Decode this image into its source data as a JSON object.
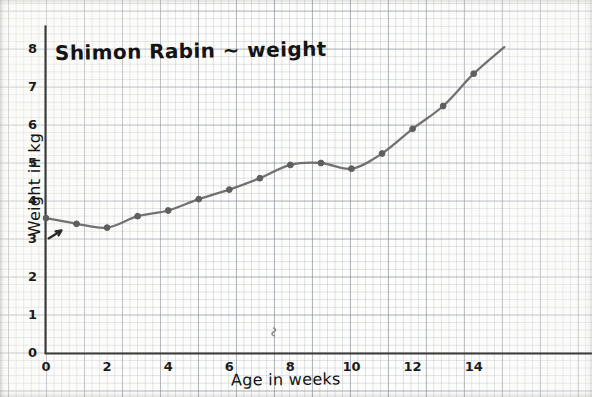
{
  "chart_data": {
    "type": "line",
    "title": "Shimon Rabin ~ weight",
    "xlabel": "Age in weeks",
    "ylabel": "Weight in kg",
    "x": [
      0,
      1,
      2,
      3,
      4,
      5,
      6,
      7,
      8,
      9,
      10,
      11,
      12,
      13,
      14,
      15
    ],
    "values": [
      3.55,
      3.4,
      3.3,
      3.6,
      3.75,
      4.05,
      4.3,
      4.6,
      4.95,
      5.0,
      4.85,
      5.25,
      5.9,
      6.5,
      7.35,
      8.05
    ],
    "series": [
      {
        "name": "Weight",
        "values": [
          3.55,
          3.4,
          3.3,
          3.6,
          3.75,
          4.05,
          4.3,
          4.6,
          4.95,
          5.0,
          4.85,
          5.25,
          5.9,
          6.5,
          7.35,
          8.05
        ]
      }
    ],
    "xlim": [
      0,
      15
    ],
    "ylim": [
      0,
      8.6
    ],
    "xticks": [
      0,
      2,
      4,
      6,
      8,
      10,
      12,
      14
    ],
    "yticks": [
      0,
      1,
      2,
      3,
      4,
      5,
      6,
      7,
      8
    ],
    "xtick_labels": [
      "0",
      "2",
      "4",
      "6",
      "8",
      "10",
      "12",
      "14"
    ],
    "ytick_labels": [
      "0",
      "1",
      "2",
      "3",
      "4",
      "5",
      "6",
      "7",
      "8"
    ],
    "grid": true,
    "grid_style": "graph-paper",
    "legend": false,
    "legend_position": "none",
    "line_color": "#6a6a6a",
    "marker_color": "#5f5f5f",
    "marker": "circle",
    "axis_color": "#3b3b3b",
    "background_color": "#fdfdfc",
    "grid_major_color": "#787d87",
    "grid_minor_color": "#969eaa",
    "annotations": [
      {
        "name": "cursor-arrow-mark",
        "x": 0.28,
        "y": 3.12
      },
      {
        "name": "pencil-squiggle-mark",
        "x": 7.45,
        "y": 0.42
      }
    ]
  },
  "axes": {
    "y_axis_name": "Weight in kg",
    "x_axis_name": "Age in weeks"
  }
}
